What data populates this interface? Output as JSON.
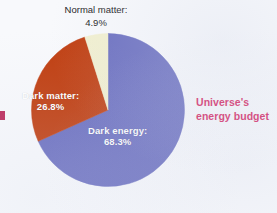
{
  "chart_data": {
    "type": "pie",
    "title": "Universe's energy budget",
    "xlabel": "",
    "ylabel": "",
    "legend_position": "none",
    "grid": false,
    "categories": [
      "Dark energy",
      "Dark matter",
      "Normal matter"
    ],
    "values": [
      68.3,
      26.8,
      4.9
    ],
    "unit": "%",
    "start_angle_deg": 0,
    "direction": "clockwise",
    "slices": [
      {
        "name": "Dark energy",
        "label": "Dark energy:",
        "value_label": "68.3%",
        "value": 68.3,
        "color": "#6b6fc0",
        "label_color": "#ffffff"
      },
      {
        "name": "Dark matter",
        "label": "Dark matter:",
        "value_label": "26.8%",
        "value": 26.8,
        "color": "#c03e10",
        "label_color": "#ffffff"
      },
      {
        "name": "Normal matter",
        "label": "Normal matter:",
        "value_label": "4.9%",
        "value": 4.9,
        "color": "#f2f0d0",
        "label_color": "#1c1c1c"
      }
    ]
  },
  "figure": {
    "title_text_line1": "Universe's",
    "title_text_line2": "energy budget",
    "title_color": "#d6215f",
    "background_color": "#f8f9fc"
  },
  "labels": {
    "dark_energy_name": "Dark energy:",
    "dark_energy_value": "68.3%",
    "dark_matter_name": "Dark matter:",
    "dark_matter_value": "26.8%",
    "normal_matter_name": "Normal matter:",
    "normal_matter_value": "4.9%"
  }
}
